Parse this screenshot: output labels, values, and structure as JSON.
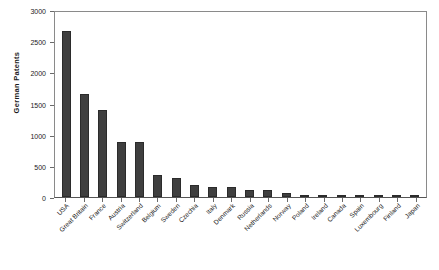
{
  "chart_data": {
    "type": "bar",
    "title": "",
    "xlabel": "",
    "ylabel": "German Patents",
    "ylim": [
      0,
      3000
    ],
    "ytick_values": [
      0,
      500,
      1000,
      1500,
      2000,
      2500,
      3000
    ],
    "ytick_labels": [
      "0",
      "500",
      "1000",
      "1500",
      "2000",
      "2500",
      "3000"
    ],
    "grid": false,
    "legend": "none",
    "bar_color": "#3f3f3f",
    "categories": [
      "USA",
      "Great Britain",
      "France",
      "Austria",
      "Switzerland",
      "Belgium",
      "Sweden",
      "Czechia",
      "Italy",
      "Denmark",
      "Russia",
      "Netherlands",
      "Norway",
      "Poland",
      "Ireland",
      "Canada",
      "Spain",
      "Luxembourg",
      "Finland",
      "Japan"
    ],
    "values": [
      2670,
      1650,
      1390,
      890,
      885,
      360,
      310,
      195,
      165,
      155,
      110,
      105,
      65,
      40,
      30,
      28,
      25,
      22,
      12,
      8
    ]
  }
}
